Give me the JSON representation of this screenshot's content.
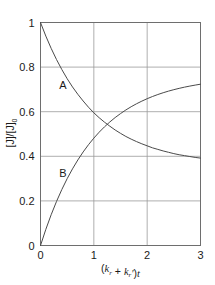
{
  "chart_data": {
    "type": "line",
    "title": "",
    "xlabel": "(k_r + k_r')t",
    "xlabel_parts": {
      "open": "(",
      "k1": "k",
      "k1_sub": "r",
      "plus": " + ",
      "k2": "k",
      "k2_sub": "r",
      "prime": "′",
      "close": ")",
      "t": "t"
    },
    "ylabel": "[J]/[J]₀",
    "ylabel_parts": {
      "num": "[J]",
      "slash": "/",
      "den": "[J]",
      "den_sub": "0"
    },
    "xlim": [
      0,
      3
    ],
    "ylim": [
      0,
      1
    ],
    "xticks": [
      0,
      1,
      2,
      3
    ],
    "xtick_labels": [
      "0",
      "1",
      "2",
      "3"
    ],
    "yticks": [
      0,
      0.2,
      0.4,
      0.6,
      0.8,
      1
    ],
    "ytick_labels": [
      "0",
      "0.2",
      "0.4",
      "0.6",
      "0.8",
      "1"
    ],
    "grid": true,
    "grid_color": "#9a9a9a",
    "frame_color": "#6e6e6e",
    "curve_color": "#4a4a4a",
    "legend": "none",
    "annotations": [
      {
        "label": "A",
        "x": 0.42,
        "y": 0.7
      },
      {
        "label": "B",
        "x": 0.42,
        "y": 0.305
      }
    ],
    "series": [
      {
        "name": "A",
        "label": "A",
        "description": "reactant J decaying to equilibrium",
        "equilibrium_value": 0.36,
        "start_value": 1.0,
        "end_value": 0.36,
        "x": [
          0,
          0.1,
          0.2,
          0.3,
          0.4,
          0.5,
          0.6,
          0.7,
          0.8,
          0.9,
          1.0,
          1.1,
          1.2,
          1.3,
          1.4,
          1.5,
          1.6,
          1.7,
          1.8,
          1.9,
          2.0,
          2.1,
          2.2,
          2.3,
          2.4,
          2.5,
          2.6,
          2.7,
          2.8,
          2.9,
          3.0
        ],
        "y": [
          1.0,
          0.939,
          0.884,
          0.834,
          0.789,
          0.748,
          0.711,
          0.678,
          0.648,
          0.62,
          0.595,
          0.573,
          0.553,
          0.535,
          0.518,
          0.503,
          0.489,
          0.477,
          0.466,
          0.456,
          0.447,
          0.438,
          0.431,
          0.424,
          0.418,
          0.412,
          0.407,
          0.403,
          0.399,
          0.395,
          0.392
        ]
      },
      {
        "name": "B",
        "label": "B",
        "description": "product rising to equilibrium",
        "equilibrium_value": 0.64,
        "start_value": 0.0,
        "end_value": 0.62,
        "x": [
          0,
          0.1,
          0.2,
          0.3,
          0.4,
          0.5,
          0.6,
          0.7,
          0.8,
          0.9,
          1.0,
          1.1,
          1.2,
          1.3,
          1.4,
          1.5,
          1.6,
          1.7,
          1.8,
          1.9,
          2.0,
          2.1,
          2.2,
          2.3,
          2.4,
          2.5,
          2.6,
          2.7,
          2.8,
          2.9,
          3.0
        ],
        "y": [
          0.0,
          0.0725,
          0.138,
          0.1974,
          0.2511,
          0.2997,
          0.3437,
          0.3835,
          0.4195,
          0.4521,
          0.4815,
          0.5081,
          0.5322,
          0.554,
          0.5737,
          0.5915,
          0.6077,
          0.6223,
          0.6355,
          0.6474,
          0.6583,
          0.6681,
          0.677,
          0.685,
          0.6923,
          0.6988,
          0.7047,
          0.7101,
          0.7149,
          0.7193,
          0.7233
        ]
      }
    ]
  }
}
